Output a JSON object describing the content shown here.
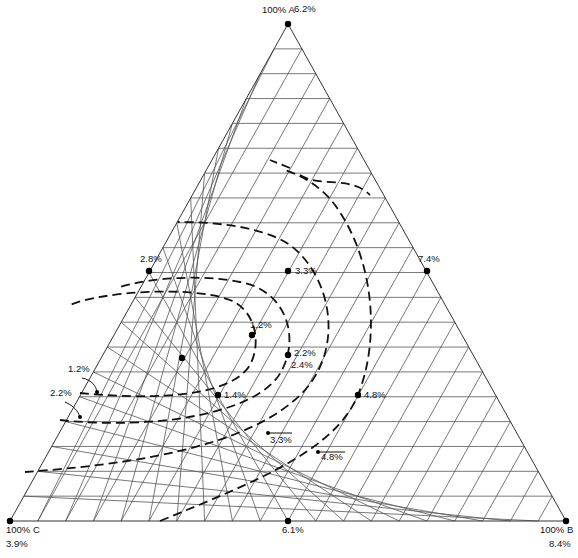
{
  "chart_data": {
    "type": "ternary-contour",
    "title": "",
    "vertices": [
      {
        "label": "100% A",
        "value": "6.2%",
        "pos": [
          288,
          24
        ]
      },
      {
        "label": "100% B",
        "value": "8.4%",
        "pos": [
          566,
          521
        ]
      },
      {
        "label": "100% C",
        "value": "3.9%",
        "pos": [
          10,
          521
        ]
      }
    ],
    "grid_divisions": 20,
    "points": [
      {
        "label": "6.2%",
        "x": 288,
        "y": 24,
        "lx": 294,
        "ly": 12
      },
      {
        "label": "2.8%",
        "x": 149,
        "y": 271,
        "lx": 140,
        "ly": 262
      },
      {
        "label": "3.3%",
        "x": 288,
        "y": 271,
        "lx": 295,
        "ly": 274
      },
      {
        "label": "7.4%",
        "x": 427,
        "y": 271,
        "lx": 418,
        "ly": 262
      },
      {
        "label": "1.2%",
        "x": 252,
        "y": 335,
        "lx": 250,
        "ly": 328
      },
      {
        "label": "",
        "x": 182,
        "y": 358,
        "lx": 0,
        "ly": 0
      },
      {
        "label": "2.2%",
        "x": 288,
        "y": 355,
        "lx": 294,
        "ly": 356
      },
      {
        "label": "1.4%",
        "x": 218,
        "y": 395,
        "lx": 224,
        "ly": 398
      },
      {
        "label": "4.8%",
        "x": 358,
        "y": 395,
        "lx": 364,
        "ly": 398
      },
      {
        "label": "6.1%",
        "x": 288,
        "y": 521,
        "lx": 282,
        "ly": 533
      },
      {
        "label": "100% C",
        "x": 10,
        "y": 521,
        "lx": 6,
        "ly": 533
      },
      {
        "label": "100% B",
        "x": 566,
        "y": 521,
        "lx": 540,
        "ly": 533
      }
    ],
    "extra_labels": [
      {
        "text": "100% A",
        "x": 262,
        "y": 13
      },
      {
        "text": "3.9%",
        "x": 6,
        "y": 547
      },
      {
        "text": "8.4%",
        "x": 549,
        "y": 547
      },
      {
        "text": "2.4%",
        "x": 291,
        "y": 368
      }
    ],
    "contours": [
      {
        "level": "1.2%",
        "path": "M 80 393 C 150 400, 230 398, 250 365 C 262 342, 255 310, 230 300 C 190 285, 100 292, 70 305"
      },
      {
        "level": "2.2%",
        "path": "M 60 420 C 150 430, 260 415, 282 370 C 300 335, 285 290, 240 282 C 200 274, 150 278, 120 287"
      },
      {
        "level": "3.3%",
        "path": "M 25 472 C 120 465, 250 450, 305 390 C 345 345, 330 275, 290 245 C 260 225, 210 222, 178 222"
      },
      {
        "level": "4.8%",
        "path": "M 160 521 C 260 480, 335 450, 358 395 C 380 340, 375 260, 335 205 C 320 185, 300 175, 285 170 M 290 168 L 270 160 M 300 175 C 320 188, 350 175, 370 195"
      }
    ],
    "annotations": [
      {
        "text": "1.2%",
        "x": 68,
        "y": 372,
        "arrow": "M 82 378 C 92 380, 96 386, 97 392"
      },
      {
        "text": "2.2%",
        "x": 50,
        "y": 396,
        "arrow": "M 65 402 C 74 406, 78 411, 80 417"
      },
      {
        "text": "3.3%",
        "x": 270,
        "y": 443,
        "arrow": "M 292 433 L 268 433"
      },
      {
        "text": "4.8%",
        "x": 321,
        "y": 460,
        "arrow": "M 345 452 L 318 452"
      }
    ]
  }
}
